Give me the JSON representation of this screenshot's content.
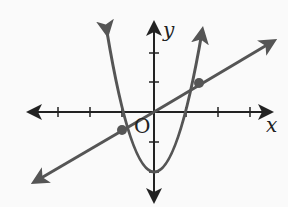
{
  "labels": {
    "y_axis": "y",
    "x_axis": "x",
    "origin": "O"
  },
  "colors": {
    "axis": "#222222",
    "curve": "#555555"
  },
  "graph": {
    "curves": [
      "parabola",
      "line"
    ],
    "intersection_points": 2,
    "parabola_vertex_y": -2
  }
}
